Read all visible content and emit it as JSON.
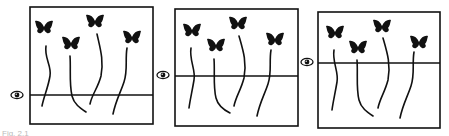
{
  "figure": {
    "colors": {
      "ink": "#111111",
      "background": "#ffffff"
    },
    "panels": [
      {
        "id": 1,
        "box": {
          "x": 30,
          "y": 7,
          "w": 123,
          "h": 117
        },
        "eye_level_y": 95,
        "eye_icon": {
          "x": 17,
          "y": 95
        },
        "butterflies": [
          {
            "x": 44,
            "y": 28,
            "string": "M46,46 C44,58 52,66 50,76 C48,88 44,96 42,106"
          },
          {
            "x": 71,
            "y": 44,
            "string": "M70,56 C71,70 69,82 72,96 C74,104 80,108 86,112"
          },
          {
            "x": 95,
            "y": 22,
            "string": "M97,34 C100,48 104,60 101,76 C98,88 92,94 90,104"
          },
          {
            "x": 132,
            "y": 38,
            "string": "M127,48 C125,60 128,70 124,82 C120,94 116,100 113,114"
          }
        ]
      },
      {
        "id": 2,
        "box": {
          "x": 175,
          "y": 9,
          "w": 123,
          "h": 117
        },
        "eye_level_y": 76,
        "eye_icon": {
          "x": 163,
          "y": 75
        },
        "butterflies": [
          {
            "x": 192,
            "y": 31,
            "string": "M191,48 C189,60 196,70 194,80 C192,92 190,100 189,108"
          },
          {
            "x": 216,
            "y": 46,
            "string": "M214,59 C215,72 213,86 216,98 C218,106 224,110 230,113"
          },
          {
            "x": 238,
            "y": 24,
            "string": "M239,36 C243,50 247,62 244,78 C241,90 236,96 234,106"
          },
          {
            "x": 275,
            "y": 40,
            "string": "M271,50 C269,62 272,72 268,84 C264,96 260,102 257,116"
          }
        ]
      },
      {
        "id": 3,
        "box": {
          "x": 318,
          "y": 12,
          "w": 122,
          "h": 116
        },
        "eye_level_y": 63,
        "eye_icon": {
          "x": 307,
          "y": 62
        },
        "butterflies": [
          {
            "x": 335,
            "y": 33,
            "string": "M334,50 C332,62 339,72 337,82 C335,94 333,102 332,110"
          },
          {
            "x": 358,
            "y": 48,
            "string": "M357,60 C358,74 356,88 359,100 C361,108 367,112 373,116"
          },
          {
            "x": 382,
            "y": 27,
            "string": "M383,38 C387,52 391,64 388,80 C385,92 380,98 378,108"
          },
          {
            "x": 419,
            "y": 43,
            "string": "M414,52 C412,64 415,74 411,86 C407,98 403,104 400,118"
          }
        ]
      }
    ],
    "caption": "Fig. 2.1"
  }
}
